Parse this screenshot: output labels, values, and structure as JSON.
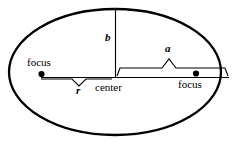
{
  "figure": {
    "type": "geometry-diagram",
    "background_color": "#ffffff",
    "stroke_color": "#000000",
    "width": 238,
    "height": 144
  },
  "shape": {
    "name": "ellipse-outline",
    "center": {
      "x": 115,
      "y": 77
    },
    "semi_major_axis_px": 113,
    "semi_minor_axis_px": 68,
    "stroke_width": 2.2
  },
  "labels": {
    "focus_left": "focus",
    "focus_right": "focus",
    "center": "center",
    "semi_major": "a",
    "semi_minor": "b",
    "radius": "r"
  },
  "points": [
    {
      "name": "focus-left-point",
      "x": 41,
      "y": 74
    },
    {
      "name": "focus-right-point",
      "x": 196,
      "y": 73
    },
    {
      "name": "center-point",
      "x": 115,
      "y": 77
    }
  ],
  "segments": [
    {
      "name": "major-axis-line",
      "x1": 41,
      "y1": 77,
      "x2": 228,
      "y2": 77
    },
    {
      "name": "semi-minor-axis-line",
      "x1": 115,
      "y1": 9,
      "x2": 115,
      "y2": 77
    }
  ],
  "braces": [
    {
      "name": "brace-r",
      "from_x": 41,
      "to_x": 112,
      "y": 80,
      "direction": "down",
      "label": "r"
    },
    {
      "name": "brace-a",
      "from_x": 118,
      "to_x": 228,
      "y": 68,
      "direction": "up",
      "label": "a"
    }
  ]
}
